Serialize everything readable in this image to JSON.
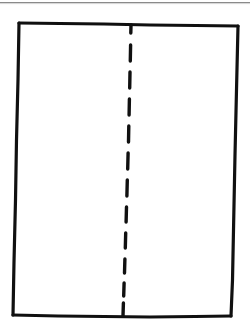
{
  "figure": {
    "title": "",
    "caption": "",
    "background_color": "#ffffff",
    "width": 250,
    "height": 334,
    "ink_color": "#101010",
    "hairline_color": "#8a8a8a"
  },
  "header_rule": {
    "name": "page-top-rule",
    "color": "#8a8a8a",
    "thickness": 1,
    "y": 2.5,
    "x_start": 0,
    "x_end": 250
  },
  "rectangle": {
    "name": "outer-rectangle",
    "stroke_color": "#101010",
    "stroke_width": 3.2,
    "corners": {
      "top_left": [
        19,
        23
      ],
      "top_right": [
        238,
        26
      ],
      "bottom_right": [
        231,
        316
      ],
      "bottom_left": [
        13,
        315
      ]
    },
    "edges": [
      {
        "name": "top-edge",
        "path": "M 19 23 L 60 23.5 L 104 24 L 150 25 L 196 25.5 L 238 26"
      },
      {
        "name": "right-edge",
        "path": "M 238 26 L 236.5 90 L 235 155 L 233.5 230 L 232.5 280 L 231 316"
      },
      {
        "name": "bottom-edge",
        "path": "M 231 316 L 195 316.5 L 150 317 L 104 316.5 L 58 316 L 13 315"
      },
      {
        "name": "left-edge",
        "path": "M 13 315 L 14 262 L 15.5 200 L 16.5 140 L 18 80 L 19 23"
      }
    ]
  },
  "dashed_line": {
    "name": "center-fold-dashed-line",
    "stroke_color": "#101010",
    "stroke_width": 3.4,
    "orientation": "vertical",
    "top_point": [
      131,
      25
    ],
    "bottom_point": [
      123,
      316
    ],
    "dash_count": 12,
    "dash_length": 15,
    "gap_length": 10,
    "dashes": [
      {
        "x1": 131.0,
        "y1": 25,
        "x2": 130.8,
        "y2": 33
      },
      {
        "x1": 130.6,
        "y1": 45,
        "x2": 130.3,
        "y2": 61
      },
      {
        "x1": 130.0,
        "y1": 72,
        "x2": 129.7,
        "y2": 88
      },
      {
        "x1": 129.4,
        "y1": 99,
        "x2": 129.1,
        "y2": 115
      },
      {
        "x1": 128.8,
        "y1": 126,
        "x2": 128.5,
        "y2": 142
      },
      {
        "x1": 128.1,
        "y1": 153,
        "x2": 127.7,
        "y2": 169
      },
      {
        "x1": 127.3,
        "y1": 180,
        "x2": 126.9,
        "y2": 196
      },
      {
        "x1": 126.5,
        "y1": 207,
        "x2": 126.1,
        "y2": 222
      },
      {
        "x1": 125.7,
        "y1": 233,
        "x2": 125.3,
        "y2": 248
      },
      {
        "x1": 124.9,
        "y1": 259,
        "x2": 124.5,
        "y2": 273
      },
      {
        "x1": 124.1,
        "y1": 283,
        "x2": 123.7,
        "y2": 296
      },
      {
        "x1": 123.4,
        "y1": 303,
        "x2": 123.0,
        "y2": 316
      }
    ]
  }
}
